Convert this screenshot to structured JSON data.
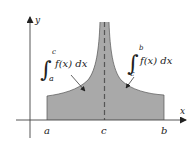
{
  "diagram": {
    "type": "improper-integral-illustration",
    "axes": {
      "x_label": "x",
      "y_label": "y"
    },
    "ticks": {
      "a": "a",
      "c": "c",
      "b": "b"
    },
    "annotations": {
      "left_integral": {
        "lower": "a",
        "upper": "c",
        "integrand": "f(x) dx"
      },
      "right_integral": {
        "lower": "c",
        "upper": "b",
        "integrand": "f(x) dx"
      }
    },
    "colors": {
      "fill": "#a9a9a9",
      "stroke": "#333333",
      "axis": "#444444",
      "asymptote": "#555555",
      "background": "#ffffff"
    }
  }
}
